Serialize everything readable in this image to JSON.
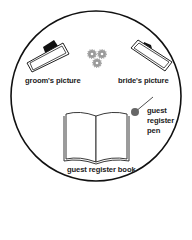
{
  "diagram": {
    "type": "table-layout",
    "items": {
      "groom_picture": "groom's picture",
      "bride_picture": "bride's picture",
      "pen_line1": "guest",
      "pen_line2": "register",
      "pen_line3": "pen",
      "book": "guest register book"
    },
    "colors": {
      "outline": "#111111",
      "pen": "#555555",
      "flower": "#888888"
    }
  }
}
